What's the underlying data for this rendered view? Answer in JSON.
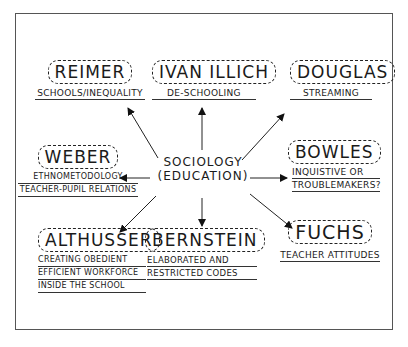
{
  "diagram": {
    "center": {
      "line1": "SOCIOLOGY",
      "line2": "(EDUCATION)"
    },
    "nodes": [
      {
        "id": "reimer",
        "name": "REIMER",
        "desc": [
          "SCHOOLS/INEQUALITY"
        ]
      },
      {
        "id": "illich",
        "name": "IVAN ILLICH",
        "desc": [
          "DE-SCHOOLING"
        ]
      },
      {
        "id": "douglas",
        "name": "DOUGLAS",
        "desc": [
          "STREAMING"
        ]
      },
      {
        "id": "weber",
        "name": "WEBER",
        "desc": [
          "ETHNOMETODOLOGY",
          "TEACHER-PUPIL RELATIONS"
        ]
      },
      {
        "id": "bowles",
        "name": "BOWLES",
        "desc": [
          "INQUISTIVE OR",
          "TROUBLEMAKERS?"
        ]
      },
      {
        "id": "althusser",
        "name": "ALTHUSSER",
        "desc": [
          "CREATING OBEDIENT",
          "EFFICIENT WORKFORCE",
          "INSIDE THE SCHOOL"
        ]
      },
      {
        "id": "bernstein",
        "name": "BERNSTEIN",
        "desc": [
          "ELABORATED AND",
          "RESTRICTED CODES"
        ]
      },
      {
        "id": "fuchs",
        "name": "FUCHS",
        "desc": [
          "TEACHER ATTITUDES"
        ]
      }
    ],
    "colors": {
      "ink": "#1a1a1a",
      "frame": "#555555",
      "background": "#ffffff"
    }
  }
}
